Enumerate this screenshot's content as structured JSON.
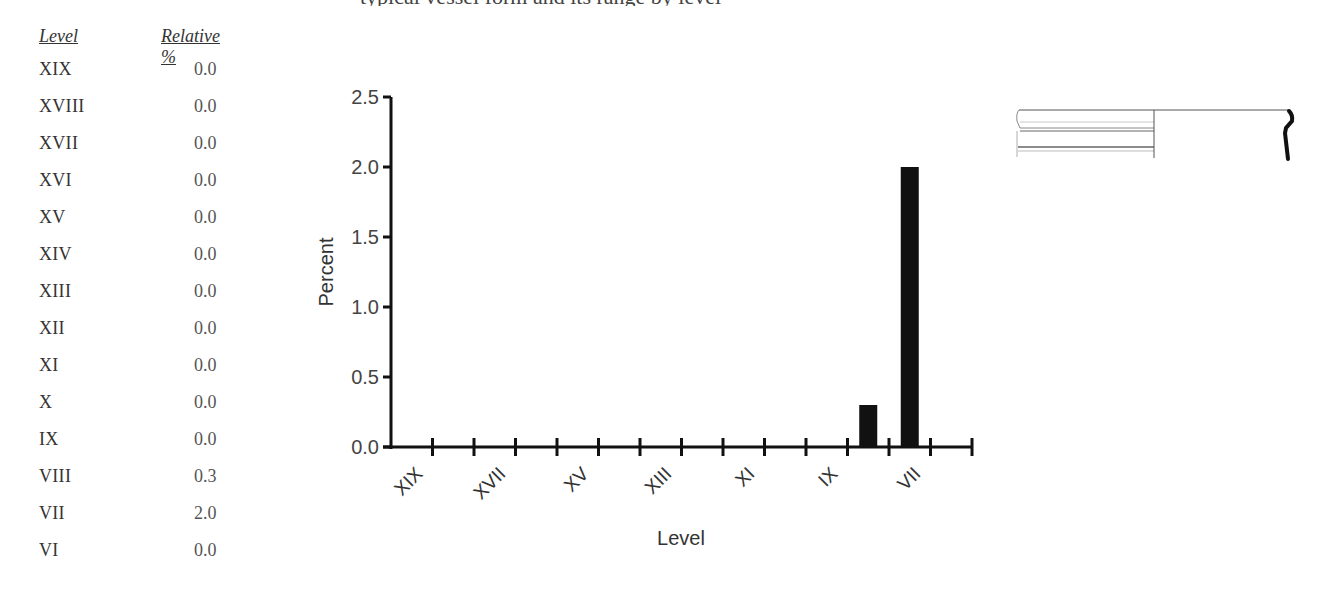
{
  "header_fragment": "typical vessel form and its range by level",
  "table": {
    "headers": {
      "level": "Level",
      "relative": "Relative %"
    },
    "rows": [
      {
        "level": "XIX",
        "value": "0.0"
      },
      {
        "level": "XVIII",
        "value": "0.0"
      },
      {
        "level": "XVII",
        "value": "0.0"
      },
      {
        "level": "XVI",
        "value": "0.0"
      },
      {
        "level": "XV",
        "value": "0.0"
      },
      {
        "level": "XIV",
        "value": "0.0"
      },
      {
        "level": "XIII",
        "value": "0.0"
      },
      {
        "level": "XII",
        "value": "0.0"
      },
      {
        "level": "XI",
        "value": "0.0"
      },
      {
        "level": "X",
        "value": "0.0"
      },
      {
        "level": "IX",
        "value": "0.0"
      },
      {
        "level": "VIII",
        "value": "0.3"
      },
      {
        "level": "VII",
        "value": "2.0"
      },
      {
        "level": "VI",
        "value": "0.0"
      }
    ]
  },
  "chart_data": {
    "type": "bar",
    "title": "",
    "xlabel": "Level",
    "ylabel": "Percent",
    "ylim": [
      0,
      2.5
    ],
    "yticks": [
      "0.0",
      "0.5",
      "1.0",
      "1.5",
      "2.0",
      "2.5"
    ],
    "categories": [
      "XIX",
      "XVIII",
      "XVII",
      "XVI",
      "XV",
      "XIV",
      "XIII",
      "XII",
      "XI",
      "X",
      "IX",
      "VIII",
      "VII",
      "VI"
    ],
    "xtick_labels_shown": [
      "XIX",
      "XVII",
      "XV",
      "XIII",
      "XI",
      "IX",
      "VII"
    ],
    "values": [
      0.0,
      0.0,
      0.0,
      0.0,
      0.0,
      0.0,
      0.0,
      0.0,
      0.0,
      0.0,
      0.0,
      0.3,
      2.0,
      0.0
    ],
    "grid": false,
    "legend": null,
    "bar_color": "#111111"
  },
  "drawing": {
    "label": "vessel-rim-profile"
  }
}
